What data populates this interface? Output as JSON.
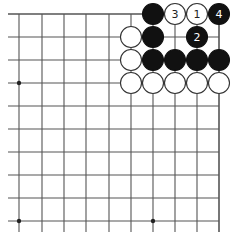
{
  "diagram": {
    "type": "go-board-corner",
    "colors": {
      "background": "#ffffff",
      "line": "#555555",
      "black_stone": "#111111",
      "white_stone": "#ffffff",
      "white_stone_border": "#333333"
    },
    "grid": {
      "columns_x": [
        19,
        42,
        64,
        86,
        109,
        131,
        153,
        175,
        197,
        219
      ],
      "rows_y": [
        14,
        37,
        60,
        83,
        106,
        129,
        152,
        175,
        198,
        221
      ],
      "left_extend_to": 8,
      "bottom_extend_to": 232,
      "top_edge": true,
      "right_edge": true
    },
    "hoshi": [
      {
        "col": 0,
        "row": 3
      },
      {
        "col": 0,
        "row": 9
      },
      {
        "col": 6,
        "row": 9
      }
    ],
    "stones": [
      {
        "col": 6,
        "row": 0,
        "color": "black",
        "label": ""
      },
      {
        "col": 7,
        "row": 0,
        "color": "white",
        "label": "3"
      },
      {
        "col": 8,
        "row": 0,
        "color": "white",
        "label": "1"
      },
      {
        "col": 9,
        "row": 0,
        "color": "black",
        "label": "4"
      },
      {
        "col": 5,
        "row": 1,
        "color": "white",
        "label": ""
      },
      {
        "col": 6,
        "row": 1,
        "color": "black",
        "label": ""
      },
      {
        "col": 8,
        "row": 1,
        "color": "black",
        "label": "2"
      },
      {
        "col": 5,
        "row": 2,
        "color": "white",
        "label": ""
      },
      {
        "col": 6,
        "row": 2,
        "color": "black",
        "label": ""
      },
      {
        "col": 7,
        "row": 2,
        "color": "black",
        "label": ""
      },
      {
        "col": 8,
        "row": 2,
        "color": "black",
        "label": ""
      },
      {
        "col": 9,
        "row": 2,
        "color": "black",
        "label": ""
      },
      {
        "col": 5,
        "row": 3,
        "color": "white",
        "label": ""
      },
      {
        "col": 6,
        "row": 3,
        "color": "white",
        "label": ""
      },
      {
        "col": 7,
        "row": 3,
        "color": "white",
        "label": ""
      },
      {
        "col": 8,
        "row": 3,
        "color": "white",
        "label": ""
      },
      {
        "col": 9,
        "row": 3,
        "color": "white",
        "label": ""
      }
    ],
    "move_labels": {
      "move_1": "1",
      "move_2": "2",
      "move_3": "3",
      "move_4": "4"
    }
  }
}
